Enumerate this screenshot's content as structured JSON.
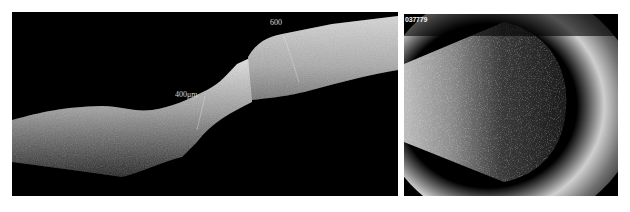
{
  "figure": {
    "panels": [
      {
        "id": "oct-panel",
        "description": "Anterior segment OCT cross-section showing scleral/corneal tissue band with thickness measurement markers",
        "annotations": [
          {
            "text": "400μm",
            "x": 163,
            "y": 84
          },
          {
            "text": "600",
            "x": 258,
            "y": 22
          }
        ]
      },
      {
        "id": "ultrasound-panel",
        "description": "B-scan ultrasound image showing dense vitreous opacities within the globe",
        "annotations": [
          {
            "text": "037779",
            "x": 405,
            "y": 15
          }
        ]
      }
    ],
    "caption": ""
  },
  "colors": {
    "background": "#ffffff",
    "panel_bg": "#000000",
    "tissue": "#bfbfbf"
  }
}
